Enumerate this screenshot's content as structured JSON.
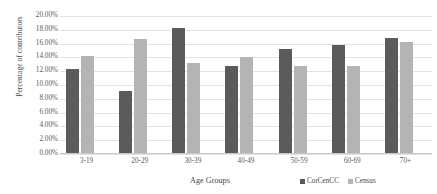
{
  "chart_data": {
    "type": "bar",
    "title": "",
    "xlabel": "Age Groups",
    "ylabel": "Percentage of contributors",
    "categories": [
      "3-19",
      "20-29",
      "30-39",
      "40-49",
      "50-59",
      "60-69",
      "70+"
    ],
    "series": [
      {
        "name": "CorCenCC",
        "color": "#5b5b5b",
        "values": [
          12.3,
          9.1,
          18.2,
          12.8,
          15.2,
          15.8,
          16.8
        ]
      },
      {
        "name": "Census",
        "color": "#b4b4b4",
        "values": [
          14.2,
          16.6,
          13.2,
          14.1,
          12.7,
          12.8,
          16.2
        ]
      }
    ],
    "ylim": [
      0,
      20
    ],
    "ytick_step": 2,
    "ytick_labels": [
      "0.00%",
      "2.00%",
      "4.00%",
      "6.00%",
      "8.00%",
      "10.00%",
      "12.00%",
      "14.00%",
      "16.00%",
      "18.00%",
      "20.00%"
    ],
    "ytick_values": [
      0,
      2,
      4,
      6,
      8,
      10,
      12,
      14,
      16,
      18,
      20
    ],
    "grid": true,
    "legend_position": "bottom-right"
  }
}
